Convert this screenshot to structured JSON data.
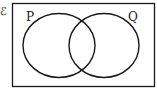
{
  "diagram": {
    "type": "venn",
    "universal_symbol": "ℰ",
    "sets": [
      {
        "label": "P"
      },
      {
        "label": "Q"
      }
    ],
    "colors": {
      "stroke": "#1a1a1a",
      "background": "#ffffff"
    }
  }
}
